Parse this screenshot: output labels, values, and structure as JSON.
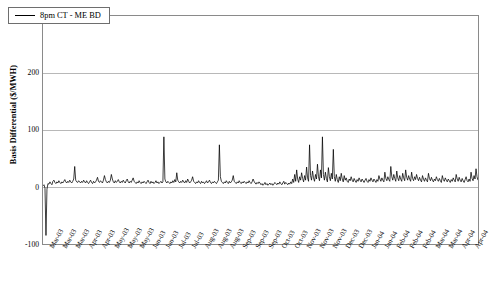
{
  "chart_data": {
    "type": "line",
    "title": "",
    "xlabel": "",
    "ylabel": "Basis Differential ($/MWH)",
    "ylim": [
      -100,
      300
    ],
    "yticks": [
      300,
      200,
      100,
      0,
      -100
    ],
    "ytick_labels": [
      "300",
      "200",
      "100",
      "0",
      "-100"
    ],
    "grid": true,
    "legend_position": "top-left",
    "series": [
      {
        "name": "8pm CT - ME BD",
        "color": "#000000",
        "values": [
          2,
          4,
          -2,
          -85,
          -4,
          6,
          5,
          9,
          6,
          4,
          10,
          12,
          8,
          6,
          9,
          7,
          11,
          8,
          6,
          9,
          7,
          10,
          13,
          9,
          7,
          10,
          8,
          12,
          9,
          7,
          10,
          14,
          36,
          12,
          9,
          8,
          11,
          9,
          7,
          10,
          8,
          12,
          9,
          7,
          11,
          8,
          6,
          9,
          12,
          8,
          6,
          10,
          7,
          9,
          12,
          17,
          10,
          8,
          11,
          9,
          7,
          12,
          20,
          13,
          9,
          7,
          10,
          8,
          12,
          22,
          14,
          9,
          7,
          11,
          8,
          10,
          13,
          9,
          7,
          10,
          8,
          12,
          9,
          7,
          11,
          14,
          9,
          7,
          10,
          8,
          12,
          16,
          10,
          8,
          6,
          9,
          7,
          11,
          8,
          6,
          9,
          7,
          10,
          8,
          6,
          9,
          12,
          8,
          6,
          10,
          7,
          9,
          6,
          8,
          11,
          7,
          9,
          6,
          8,
          10,
          7,
          9,
          88,
          14,
          9,
          7,
          10,
          8,
          6,
          9,
          7,
          11,
          8,
          13,
          9,
          25,
          12,
          9,
          7,
          10,
          8,
          12,
          9,
          7,
          11,
          8,
          14,
          10,
          7,
          9,
          12,
          18,
          10,
          8,
          6,
          9,
          7,
          11,
          8,
          6,
          10,
          7,
          9,
          6,
          8,
          11,
          7,
          9,
          12,
          8,
          6,
          9,
          7,
          10,
          8,
          6,
          9,
          12,
          74,
          18,
          10,
          8,
          6,
          9,
          7,
          11,
          8,
          6,
          10,
          7,
          9,
          12,
          20,
          10,
          8,
          6,
          9,
          7,
          11,
          8,
          6,
          9,
          7,
          10,
          8,
          6,
          9,
          7,
          11,
          8,
          6,
          9,
          14,
          10,
          7,
          5,
          8,
          6,
          9,
          7,
          4,
          6,
          3,
          5,
          8,
          4,
          6,
          3,
          5,
          7,
          4,
          6,
          3,
          5,
          8,
          6,
          4,
          7,
          5,
          9,
          6,
          4,
          7,
          10,
          5,
          8,
          6,
          4,
          7,
          5,
          9,
          6,
          14,
          8,
          22,
          10,
          30,
          14,
          8,
          18,
          12,
          25,
          15,
          9,
          20,
          12,
          35,
          16,
          10,
          74,
          20,
          12,
          28,
          16,
          10,
          22,
          14,
          40,
          18,
          11,
          30,
          16,
          88,
          22,
          12,
          26,
          15,
          9,
          34,
          18,
          11,
          24,
          14,
          66,
          18,
          10,
          22,
          13,
          8,
          18,
          11,
          24,
          14,
          9,
          20,
          12,
          16,
          10,
          8,
          14,
          11,
          18,
          12,
          9,
          15,
          11,
          8,
          13,
          10,
          16,
          12,
          9,
          14,
          11,
          8,
          12,
          15,
          10,
          8,
          13,
          10,
          16,
          12,
          9,
          14,
          11,
          8,
          13,
          10,
          20,
          14,
          10,
          16,
          12,
          9,
          26,
          15,
          11,
          18,
          13,
          10,
          36,
          18,
          12,
          22,
          15,
          10,
          28,
          16,
          11,
          20,
          14,
          10,
          24,
          16,
          11,
          30,
          17,
          12,
          20,
          14,
          10,
          26,
          15,
          11,
          18,
          13,
          22,
          15,
          11,
          17,
          12,
          9,
          20,
          14,
          10,
          16,
          12,
          9,
          24,
          15,
          11,
          17,
          12,
          9,
          14,
          11,
          18,
          13,
          10,
          15,
          11,
          8,
          20,
          13,
          10,
          16,
          12,
          9,
          14,
          11,
          8,
          13,
          10,
          16,
          12,
          9,
          22,
          14,
          10,
          17,
          12,
          9,
          15,
          11,
          8,
          13,
          18,
          11,
          9,
          14,
          10,
          26,
          15,
          11,
          20,
          14,
          32,
          18,
          12
        ]
      }
    ],
    "xtick_labels": [
      "Mar-03",
      "Mar-03",
      "Mar-03",
      "Apr-03",
      "Apr-03",
      "May-03",
      "May-03",
      "May-03",
      "Jun-03",
      "Jun-03",
      "Jul-03",
      "Jul-03",
      "Aug-03",
      "Aug-03",
      "Aug-03",
      "Sep-03",
      "Sep-03",
      "Sep-03",
      "Oct-03",
      "Oct-03",
      "Nov-03",
      "Nov-03",
      "Nov-03",
      "Dec-03",
      "Dec-03",
      "Jan-04",
      "Jan-04",
      "Feb-04",
      "Feb-04",
      "Feb-04",
      "Mar-04",
      "Mar-04",
      "Apr-04",
      "Apr-04"
    ]
  },
  "legend": {
    "label": "8pm CT - ME BD"
  }
}
